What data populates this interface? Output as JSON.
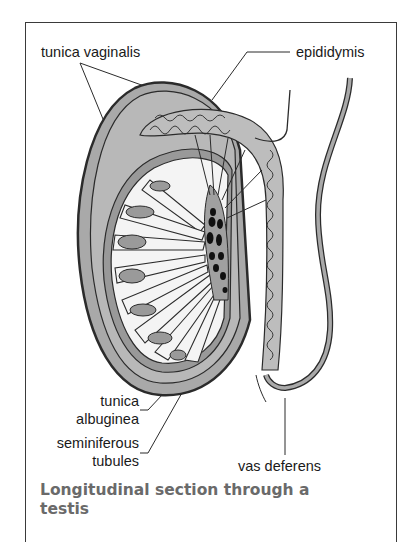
{
  "figure": {
    "labels": {
      "tunica_vaginalis": "tunica vaginalis",
      "epididymis": "epididymis",
      "tunica_albuginea_line1": "tunica",
      "tunica_albuginea_line2": "albuginea",
      "seminiferous_line1": "seminiferous",
      "seminiferous_line2": "tubules",
      "vas_deferens": "vas deferens"
    },
    "caption": {
      "line1": "Longitudinal section through a",
      "line2": "testis"
    },
    "colors": {
      "outline": "#2b2b2b",
      "fill_gray": "#a9a9a9",
      "fill_light": "#f4f4f4",
      "dark_ducts": "#111111",
      "caption": "#6a6a6a"
    }
  }
}
